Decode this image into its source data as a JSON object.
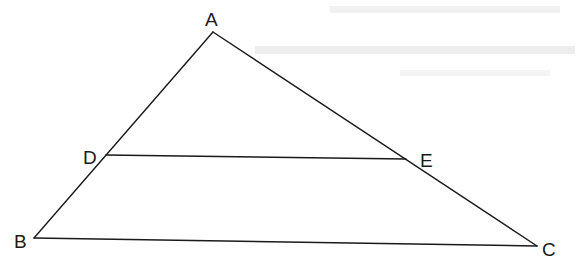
{
  "diagram": {
    "type": "triangle-with-parallel-segment",
    "points": {
      "A": {
        "x": 213,
        "y": 32
      },
      "B": {
        "x": 34,
        "y": 238
      },
      "C": {
        "x": 537,
        "y": 246
      },
      "D": {
        "x": 106,
        "y": 155
      },
      "E": {
        "x": 406,
        "y": 159
      }
    },
    "labels": {
      "A": "A",
      "B": "B",
      "C": "C",
      "D": "D",
      "E": "E"
    },
    "segments": [
      "AB",
      "AC",
      "BC",
      "DE"
    ],
    "colors": {
      "line": "#1a1a1a",
      "background": "#ffffff",
      "show_through_text": "#e4e4e4"
    }
  }
}
